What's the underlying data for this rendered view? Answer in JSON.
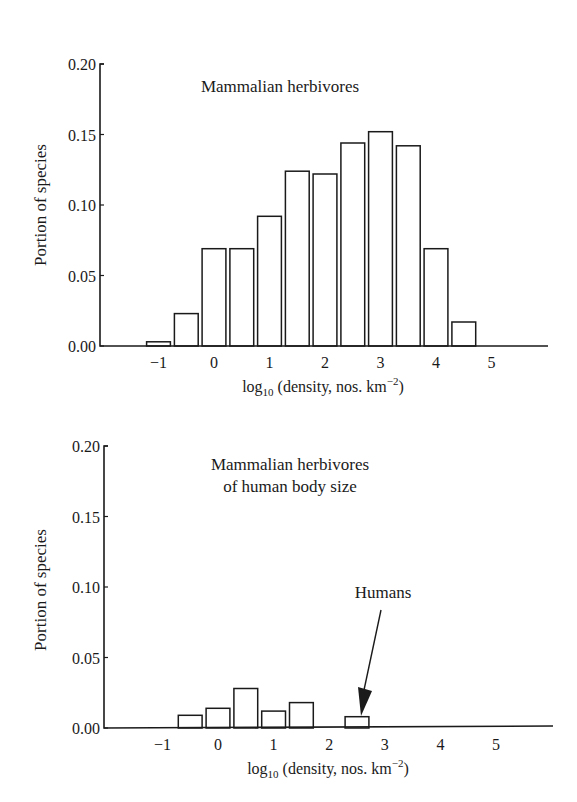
{
  "chart_data": [
    {
      "type": "bar",
      "title": "Mammalian herbivores",
      "xlabel": "log10 (density, nos. km−2)",
      "ylabel": "Portion of species",
      "ylim": [
        0,
        0.2
      ],
      "yticks": [
        "0.00",
        "0.05",
        "0.10",
        "0.15",
        "0.20"
      ],
      "xticks": [
        "−1",
        "0",
        "1",
        "2",
        "3",
        "4",
        "5"
      ],
      "xlim": [
        -2,
        6
      ],
      "grid": false,
      "bin_width": 0.5,
      "categories": [
        -1.0,
        -0.5,
        0.0,
        0.5,
        1.0,
        1.5,
        2.0,
        2.5,
        3.0,
        3.5,
        4.0,
        4.5
      ],
      "values": [
        0.003,
        0.023,
        0.069,
        0.069,
        0.092,
        0.124,
        0.122,
        0.144,
        0.152,
        0.142,
        0.069,
        0.017
      ]
    },
    {
      "type": "bar",
      "title": "Mammalian herbivores of human body size",
      "title_lines": [
        "Mammalian herbivores",
        "of human body size"
      ],
      "xlabel": "log10 (density, nos. km−2)",
      "ylabel": "Portion of species",
      "ylim": [
        0,
        0.2
      ],
      "yticks": [
        "0.00",
        "0.05",
        "0.10",
        "0.15",
        "0.20"
      ],
      "xticks": [
        "−1",
        "0",
        "1",
        "2",
        "3",
        "4",
        "5"
      ],
      "xlim": [
        -2,
        6
      ],
      "grid": false,
      "bin_width": 0.5,
      "categories": [
        -0.5,
        0.0,
        0.5,
        1.0,
        1.5,
        2.5
      ],
      "values": [
        0.009,
        0.014,
        0.028,
        0.012,
        0.018,
        0.008
      ],
      "annotations": [
        {
          "text": "Humans",
          "x": 2.5,
          "y": 0.008,
          "type": "arrow"
        }
      ]
    }
  ],
  "labels": {
    "top_title": "Mammalian herbivores",
    "bottom_title_line1": "Mammalian herbivores",
    "bottom_title_line2": "of human body size",
    "ylabel": "Portion of species",
    "xlabel_prefix": "log",
    "xlabel_sub": "10",
    "xlabel_mid": " (density, nos. km",
    "xlabel_sup": "−2",
    "xlabel_suffix": ")",
    "humans": "Humans"
  }
}
